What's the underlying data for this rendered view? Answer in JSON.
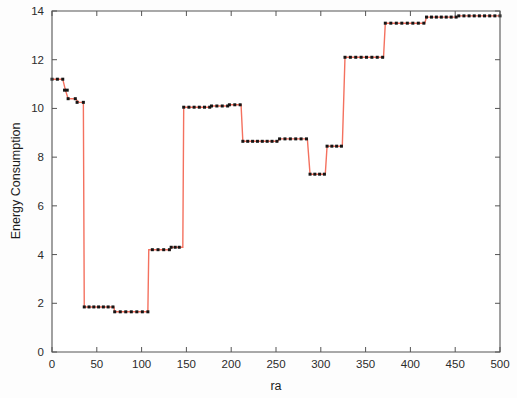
{
  "chart_data": {
    "type": "line",
    "title": "",
    "subtitle": "",
    "xlabel": "ra",
    "ylabel": "Energy Consumption",
    "xlim": [
      0,
      500
    ],
    "ylim": [
      0,
      14
    ],
    "xticks": [
      0,
      50,
      100,
      150,
      200,
      250,
      300,
      350,
      400,
      450,
      500
    ],
    "xticklabels": [
      "0",
      "50",
      "100",
      "150",
      "200",
      "250",
      "300",
      "350",
      "400",
      "450",
      "500"
    ],
    "yticks": [
      0,
      2,
      4,
      6,
      8,
      10,
      12,
      14
    ],
    "yticklabels": [
      "0",
      "2",
      "4",
      "6",
      "8",
      "10",
      "12",
      "14"
    ],
    "grid": false,
    "legend": null,
    "legend_position": "none",
    "line_color": "#F4715F",
    "marker_color": "#151515",
    "marker_style": "square",
    "line_width": 1.4,
    "marker_size": 3,
    "box_on": true,
    "annotations": [],
    "steps": [
      {
        "x_start": 0,
        "x_end": 12,
        "y": 11.2
      },
      {
        "x_start": 14,
        "x_end": 17,
        "y": 10.75
      },
      {
        "x_start": 18,
        "x_end": 26,
        "y": 10.4
      },
      {
        "x_start": 28,
        "x_end": 35,
        "y": 10.25
      },
      {
        "x_start": 36,
        "x_end": 68,
        "y": 1.85
      },
      {
        "x_start": 70,
        "x_end": 107,
        "y": 1.65
      },
      {
        "x_start": 112,
        "x_end": 131,
        "y": 4.2
      },
      {
        "x_start": 133,
        "x_end": 142,
        "y": 4.3
      },
      {
        "x_start": 147,
        "x_end": 176,
        "y": 10.05
      },
      {
        "x_start": 178,
        "x_end": 196,
        "y": 10.1
      },
      {
        "x_start": 198,
        "x_end": 210,
        "y": 10.15
      },
      {
        "x_start": 213,
        "x_end": 251,
        "y": 8.65
      },
      {
        "x_start": 254,
        "x_end": 284,
        "y": 8.75
      },
      {
        "x_start": 288,
        "x_end": 304,
        "y": 7.3
      },
      {
        "x_start": 307,
        "x_end": 323,
        "y": 8.45
      },
      {
        "x_start": 327,
        "x_end": 369,
        "y": 12.1
      },
      {
        "x_start": 372,
        "x_end": 415,
        "y": 13.5
      },
      {
        "x_start": 418,
        "x_end": 451,
        "y": 13.75
      },
      {
        "x_start": 454,
        "x_end": 500,
        "y": 13.8
      }
    ],
    "x": [
      0,
      4,
      8,
      12,
      15,
      18,
      22,
      26,
      30,
      34,
      35,
      36,
      40,
      44,
      48,
      52,
      56,
      60,
      64,
      68,
      69,
      70,
      74,
      78,
      82,
      86,
      90,
      94,
      98,
      102,
      107,
      108,
      112,
      116,
      120,
      124,
      128,
      131,
      132,
      133,
      137,
      141,
      142,
      146,
      147,
      151,
      155,
      159,
      163,
      167,
      171,
      176,
      177,
      178,
      182,
      186,
      190,
      196,
      197,
      198,
      202,
      206,
      210,
      211,
      213,
      217,
      221,
      225,
      229,
      233,
      237,
      241,
      245,
      251,
      252,
      254,
      258,
      262,
      266,
      270,
      274,
      278,
      284,
      285,
      288,
      292,
      296,
      300,
      304,
      305,
      307,
      311,
      315,
      319,
      323,
      324,
      327,
      331,
      335,
      339,
      343,
      347,
      351,
      355,
      359,
      363,
      369,
      370,
      372,
      376,
      380,
      384,
      388,
      392,
      396,
      400,
      404,
      408,
      415,
      416,
      418,
      422,
      426,
      430,
      434,
      438,
      442,
      446,
      451,
      452,
      454,
      458,
      462,
      466,
      470,
      474,
      478,
      482,
      486,
      490,
      494,
      500
    ],
    "y": [
      11.2,
      11.2,
      11.2,
      11.2,
      10.75,
      10.4,
      10.4,
      10.4,
      10.25,
      10.25,
      10.25,
      1.85,
      1.85,
      1.85,
      1.85,
      1.85,
      1.85,
      1.85,
      1.85,
      1.85,
      1.85,
      1.65,
      1.65,
      1.65,
      1.65,
      1.65,
      1.65,
      1.65,
      1.65,
      1.65,
      1.65,
      4.2,
      4.2,
      4.2,
      4.2,
      4.2,
      4.2,
      4.2,
      4.2,
      4.3,
      4.3,
      4.3,
      4.3,
      4.3,
      10.05,
      10.05,
      10.05,
      10.05,
      10.05,
      10.05,
      10.05,
      10.05,
      10.05,
      10.1,
      10.1,
      10.1,
      10.1,
      10.1,
      10.1,
      10.15,
      10.15,
      10.15,
      10.15,
      10.15,
      8.65,
      8.65,
      8.65,
      8.65,
      8.65,
      8.65,
      8.65,
      8.65,
      8.65,
      8.65,
      8.65,
      8.75,
      8.75,
      8.75,
      8.75,
      8.75,
      8.75,
      8.75,
      8.75,
      8.75,
      7.3,
      7.3,
      7.3,
      7.3,
      7.3,
      7.3,
      8.45,
      8.45,
      8.45,
      8.45,
      8.45,
      8.45,
      12.1,
      12.1,
      12.1,
      12.1,
      12.1,
      12.1,
      12.1,
      12.1,
      12.1,
      12.1,
      12.1,
      12.1,
      13.5,
      13.5,
      13.5,
      13.5,
      13.5,
      13.5,
      13.5,
      13.5,
      13.5,
      13.5,
      13.5,
      13.5,
      13.75,
      13.75,
      13.75,
      13.75,
      13.75,
      13.75,
      13.75,
      13.75,
      13.75,
      13.75,
      13.8,
      13.8,
      13.8,
      13.8,
      13.8,
      13.8,
      13.8,
      13.8,
      13.8,
      13.8,
      13.8,
      13.8
    ]
  }
}
